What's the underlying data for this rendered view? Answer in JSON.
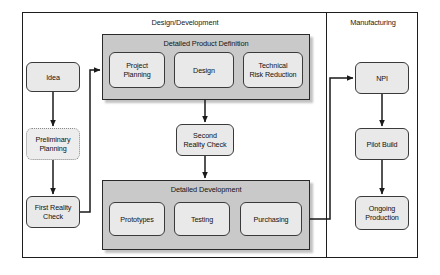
{
  "diagram": {
    "sections": [
      {
        "id": "design_development",
        "label": "Design/Development"
      },
      {
        "id": "manufacturing",
        "label": "Manufacturing"
      }
    ],
    "groups": [
      {
        "id": "detailed_product_definition",
        "label": "Detailed Product Definition"
      },
      {
        "id": "detailed_development",
        "label": "Detailed Development"
      }
    ],
    "nodes": {
      "idea": {
        "label": "Idea",
        "style": "solid"
      },
      "preliminary_planning": {
        "line1": "Preliminary",
        "line2": "Planning",
        "style": "dotted"
      },
      "first_reality_check": {
        "line1": "First Reality",
        "line2": "Check",
        "style": "solid"
      },
      "project_planning": {
        "line1": "Project",
        "line2": "Planning",
        "style": "solid"
      },
      "design": {
        "label": "Design",
        "style": "solid"
      },
      "technical_risk_reduction": {
        "line1": "Technical",
        "line2": "Risk Reduction",
        "style": "solid"
      },
      "second_reality_check": {
        "line1": "Second",
        "line2": "Reality Check",
        "style": "solid"
      },
      "prototypes": {
        "label": "Prototypes",
        "style": "solid"
      },
      "testing": {
        "label": "Testing",
        "style": "solid"
      },
      "purchasing": {
        "label": "Purchasing",
        "style": "solid"
      },
      "npi": {
        "label": "NPI",
        "style": "solid"
      },
      "pilot_build": {
        "line1": "Pilot Build",
        "style": "solid"
      },
      "ongoing_production": {
        "line1": "Ongoing",
        "line2": "Production",
        "style": "solid"
      }
    },
    "edges": [
      {
        "from": "idea",
        "to": "preliminary_planning"
      },
      {
        "from": "preliminary_planning",
        "to": "first_reality_check"
      },
      {
        "from": "first_reality_check",
        "to": "project_planning"
      },
      {
        "from": "detailed_product_definition",
        "to": "second_reality_check"
      },
      {
        "from": "second_reality_check",
        "to": "detailed_development"
      },
      {
        "from": "detailed_development",
        "to": "npi"
      },
      {
        "from": "npi",
        "to": "pilot_build"
      },
      {
        "from": "pilot_build",
        "to": "ongoing_production"
      }
    ],
    "colors": {
      "frame_stroke": "#1d1d1d",
      "group_fill": "#c9c9c9",
      "group_stroke": "#2a2a2a",
      "node_fill": "#e9e9e9",
      "node_stroke": "#3a3a3a",
      "dotted_node_stroke": "#8a8a8a",
      "connector": "#1a1a1a",
      "background": "#ffffff"
    }
  }
}
